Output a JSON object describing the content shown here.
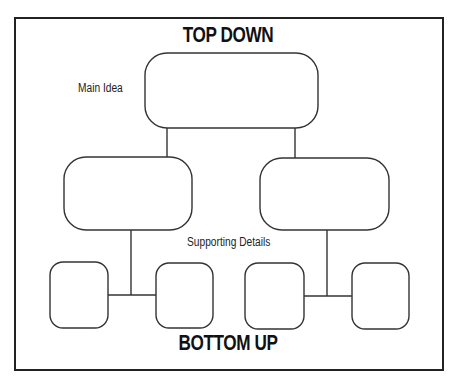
{
  "diagram": {
    "titles": {
      "top": "TOP DOWN",
      "bottom": "BOTTOM UP"
    },
    "labels": {
      "main_idea": "Main Idea",
      "supporting_details": "Supporting Details"
    },
    "colors": {
      "stroke": "#333333",
      "frame": "#222222",
      "background": "#ffffff"
    },
    "nodes": {
      "main": {
        "x": 145,
        "y": 53,
        "w": 173,
        "h": 75,
        "r": 22
      },
      "mid_left": {
        "x": 64,
        "y": 157,
        "w": 128,
        "h": 73,
        "r": 22
      },
      "mid_right": {
        "x": 260,
        "y": 158,
        "w": 129,
        "h": 72,
        "r": 22
      },
      "detail_1": {
        "x": 50,
        "y": 262,
        "w": 58,
        "h": 66,
        "r": 13
      },
      "detail_2": {
        "x": 156,
        "y": 263,
        "w": 57,
        "h": 65,
        "r": 13
      },
      "detail_3": {
        "x": 245,
        "y": 263,
        "w": 59,
        "h": 66,
        "r": 13
      },
      "detail_4": {
        "x": 352,
        "y": 263,
        "w": 57,
        "h": 66,
        "r": 13
      }
    }
  }
}
